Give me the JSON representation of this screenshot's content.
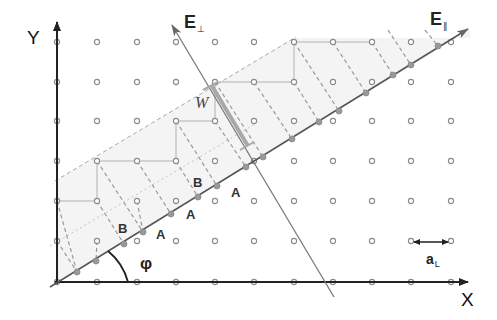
{
  "diagram": {
    "axes": {
      "x_label": "X",
      "y_label": "Y"
    },
    "spaces": {
      "parallel": {
        "label": "E",
        "subscript": "∥"
      },
      "perpendicular": {
        "label": "E",
        "subscript": "⊥"
      }
    },
    "window_label": "W",
    "angle_label": "φ",
    "lattice_constant": {
      "label": "a",
      "subscript": "L"
    },
    "chain_labels": [
      {
        "text": "B",
        "x": 118,
        "y": 222
      },
      {
        "text": "A",
        "x": 156,
        "y": 228
      },
      {
        "text": "A",
        "x": 186,
        "y": 208
      },
      {
        "text": "B",
        "x": 193,
        "y": 176
      },
      {
        "text": "A",
        "x": 231,
        "y": 186
      }
    ],
    "colors": {
      "axis": "#222222",
      "lattice_point": "#8a8a8a",
      "projected_point": "#8f8f8f",
      "e_parallel": "#555555",
      "e_perp": "#7a7a7a",
      "strip_fill": "#f3f3f3",
      "dashed": "#9a9a9a",
      "window_bar": "#a0a0a0"
    },
    "lattice": {
      "columns_x": [
        57,
        97,
        137,
        176,
        215,
        254,
        294,
        333,
        372,
        411,
        451
      ],
      "rows_y": [
        42,
        82,
        121,
        161,
        201,
        241,
        282
      ]
    },
    "origin": {
      "x": 57,
      "y": 282
    },
    "staircase_path": [
      [
        57,
        201
      ],
      [
        97,
        201
      ],
      [
        97,
        161
      ],
      [
        137,
        161
      ],
      [
        176,
        161
      ],
      [
        176,
        121
      ],
      [
        215,
        121
      ],
      [
        215,
        82
      ],
      [
        254,
        82
      ],
      [
        294,
        82
      ],
      [
        294,
        42
      ],
      [
        333,
        42
      ],
      [
        372,
        42
      ]
    ],
    "projected_points": [
      [
        77,
        272
      ],
      [
        96,
        261
      ],
      [
        124,
        244
      ],
      [
        143,
        232
      ],
      [
        171,
        214
      ],
      [
        198,
        197
      ],
      [
        217,
        186
      ],
      [
        246,
        167
      ],
      [
        263,
        157
      ],
      [
        292,
        139
      ],
      [
        319,
        122
      ],
      [
        339,
        111
      ],
      [
        366,
        93
      ],
      [
        393,
        75
      ],
      [
        411,
        65
      ],
      [
        438,
        46
      ]
    ]
  }
}
